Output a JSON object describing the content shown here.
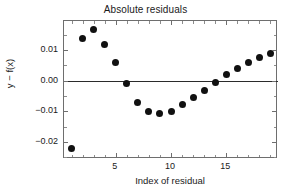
{
  "chart_data": {
    "type": "scatter",
    "title": "Absolute residuals",
    "xlabel": "Index of residual",
    "ylabel": "y − f(x)",
    "x": [
      1,
      2,
      3,
      4,
      5,
      6,
      7,
      8,
      9,
      10,
      11,
      12,
      13,
      14,
      15,
      16,
      17,
      18,
      19
    ],
    "values": [
      -0.022,
      0.0138,
      0.0168,
      0.012,
      0.006,
      -0.001,
      -0.007,
      -0.01,
      -0.0108,
      -0.01,
      -0.0077,
      -0.0055,
      -0.003,
      -0.0005,
      0.002,
      0.004,
      0.006,
      0.0077,
      0.009
    ],
    "xlim": [
      0.3,
      19.7
    ],
    "ylim": [
      -0.0255,
      0.0195
    ],
    "xticks": [
      5,
      10,
      15
    ],
    "xtick_labels": [
      "5",
      "10",
      "15"
    ],
    "xticks_minor": [
      1,
      2,
      3,
      4,
      6,
      7,
      8,
      9,
      11,
      12,
      13,
      14,
      16,
      17,
      18,
      19
    ],
    "yticks": [
      0.01,
      0.0,
      -0.01,
      -0.02
    ],
    "ytick_labels": [
      "0.01",
      "0.00",
      "−0.01",
      "−0.02"
    ],
    "yticks_minor": [
      0.015,
      0.005,
      -0.005,
      -0.015,
      -0.025
    ],
    "grid": false,
    "legend": null,
    "annotations": [
      {
        "name": "zero-reference-line",
        "type": "hline",
        "y": 0.0,
        "color": "#2b2b2b"
      }
    ],
    "marker": {
      "shape": "circle",
      "color": "#111111",
      "size": 7
    },
    "frame_color": "#6e6e6e",
    "background": "#ffffff"
  }
}
